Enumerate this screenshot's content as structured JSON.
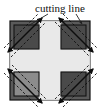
{
  "figure": {
    "canvas": {
      "width": 101,
      "height": 108,
      "background": "#ffffff"
    }
  },
  "annotations": {
    "cutting_line_label": "cutting line",
    "label_position": {
      "x": 35,
      "y": 12
    }
  },
  "shapes": {
    "outer_square": {
      "name": "outer-square",
      "x": 10,
      "y": 21,
      "width": 80,
      "height": 79,
      "fill": "#5a5a5a",
      "stroke": "#111111"
    },
    "center_cross": {
      "name": "center-cross",
      "fill": "#e9e9e9",
      "stroke": "#b8b8b8",
      "arm_half_width": 11
    },
    "corner_blocks": [
      {
        "name": "corner-top-left",
        "x": 14,
        "y": 25,
        "width": 25,
        "height": 24,
        "fill": "#4a4a4a",
        "stroke": "#141414",
        "diagonal": "bl-tr"
      },
      {
        "name": "corner-top-right",
        "x": 61,
        "y": 25,
        "width": 25,
        "height": 24,
        "fill": "#4a4a4a",
        "stroke": "#141414",
        "diagonal": "tl-br"
      },
      {
        "name": "corner-bottom-left",
        "x": 14,
        "y": 72,
        "width": 25,
        "height": 24,
        "fill": "#8c8c8c",
        "stroke": "#141414",
        "diagonal": "tl-br"
      },
      {
        "name": "corner-bottom-right",
        "x": 61,
        "y": 72,
        "width": 25,
        "height": 24,
        "fill": "#4a4a4a",
        "stroke": "#141414",
        "diagonal": "bl-tr"
      }
    ]
  },
  "cutting_lines": {
    "stroke": "#0d0d0d",
    "solid_width": 1.4,
    "dash_width": 0.9,
    "dash_pattern": "2.5,2",
    "count": 4,
    "offsets": [
      -4,
      4
    ]
  },
  "leaders": {
    "stroke": "#222222",
    "width": 0.8,
    "left": {
      "x1": 48,
      "y1": 14,
      "x2": 27,
      "y2": 27
    },
    "right": {
      "x1": 76,
      "y1": 14,
      "x2": 82,
      "y2": 24
    }
  },
  "colors": {
    "background": "#ffffff",
    "body_gray": "#5a5a5a",
    "corner_dark": "#4a4a4a",
    "corner_light": "#8c8c8c",
    "cross_light": "#e9e9e9",
    "ink": "#111111"
  }
}
